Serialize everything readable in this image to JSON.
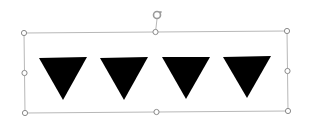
{
  "slide": {
    "background": "#ffffff",
    "selection": {
      "border_color": "#b8b8b8",
      "handle_stroke": "#8a8a8a",
      "handle_fill": "#ffffff",
      "corners": {
        "top_left": [
          24,
          33
        ],
        "top_right": [
          287,
          31
        ],
        "bottom_right": [
          288,
          111
        ],
        "bottom_left": [
          25,
          113
        ]
      },
      "rotation_handle": {
        "x": 157,
        "y": 15,
        "color": "#9a9a9a"
      }
    },
    "shapes": [
      {
        "name": "triangle-1",
        "type": "down-triangle",
        "fill": "#000000",
        "points": [
          [
            39,
            58
          ],
          [
            87,
            57
          ],
          [
            63,
            100
          ]
        ]
      },
      {
        "name": "triangle-2",
        "type": "down-triangle",
        "fill": "#000000",
        "points": [
          [
            100,
            58
          ],
          [
            148,
            57
          ],
          [
            124,
            100
          ]
        ]
      },
      {
        "name": "triangle-3",
        "type": "down-triangle",
        "fill": "#000000",
        "points": [
          [
            162,
            57
          ],
          [
            210,
            57
          ],
          [
            186,
            99
          ]
        ]
      },
      {
        "name": "triangle-4",
        "type": "down-triangle",
        "fill": "#000000",
        "points": [
          [
            223,
            57
          ],
          [
            271,
            56
          ],
          [
            247,
            98
          ]
        ]
      }
    ]
  }
}
